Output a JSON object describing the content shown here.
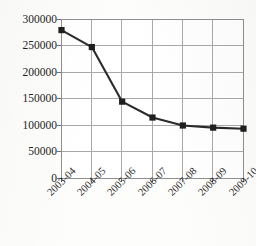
{
  "chart": {
    "title": "",
    "title_visible_fragment": ""
  },
  "chart_data": {
    "type": "line",
    "title": "",
    "xlabel": "",
    "ylabel": "",
    "categories": [
      "2003-04",
      "2004-05",
      "2005-06",
      "2006-07",
      "2007-08",
      "2008-09",
      "2009-10"
    ],
    "values": [
      280000,
      248000,
      145000,
      115000,
      100000,
      96000,
      94000
    ],
    "ylim": [
      0,
      300000
    ],
    "ytick_labels": [
      "0",
      "50000",
      "100000",
      "150000",
      "200000",
      "250000",
      "300000"
    ],
    "ytick_values": [
      0,
      50000,
      100000,
      150000,
      200000,
      250000,
      300000
    ],
    "grid": true,
    "legend": "none",
    "marker": "square",
    "line_color": "#2b2b2b",
    "marker_color": "#1f1f1f",
    "grid_color": "#a9a9a9",
    "axis_color": "#8f8f8f",
    "background_color": "#fdfdfc",
    "xtick_rotation": -45
  }
}
